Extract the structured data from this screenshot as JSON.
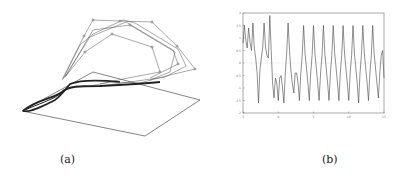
{
  "figure": {
    "panels": [
      {
        "id": "a",
        "caption": "(a)",
        "description": "3D trajectory plot: thick dense loop curve near a plane with polygonal control-point overlays above"
      },
      {
        "id": "b",
        "caption": "(b)",
        "description": "Time series oscillation plot"
      }
    ]
  },
  "captions": {
    "a": "(a)",
    "b": "(b)"
  },
  "chart_data": [
    {
      "type": "line",
      "title": "",
      "xlabel": "",
      "ylabel": "",
      "x_ticks": [
        "-5",
        "0",
        "5",
        "10",
        "15"
      ],
      "y_ticks": [
        "2",
        "1.5",
        "1",
        "0.5",
        "0",
        "-0.5",
        "-1",
        "-1.5",
        "-2"
      ],
      "xlim": [
        -5,
        15
      ],
      "ylim": [
        -2,
        2
      ],
      "grid": false,
      "series": [
        {
          "name": "signal",
          "x": [
            -5,
            -4.8,
            -4.6,
            -4.4,
            -4.2,
            -4.0,
            -3.8,
            -3.6,
            -3.4,
            -3.2,
            -3.0,
            -2.8,
            -2.6,
            -2.4,
            -2.2,
            -2.0,
            -1.8,
            -1.6,
            -1.4,
            -1.2,
            -1.0,
            -0.8,
            -0.6,
            -0.4,
            -0.2,
            0.0,
            0.2,
            0.4,
            0.6,
            0.8,
            1.0,
            1.2,
            1.4,
            1.6,
            1.8,
            2.0,
            2.2,
            2.4,
            2.6,
            2.8,
            3.0,
            3.2,
            3.4,
            3.6,
            3.8,
            4.0,
            4.2,
            4.4,
            4.6,
            4.8,
            5.0,
            5.2,
            5.4,
            5.6,
            5.8,
            6.0,
            6.2,
            6.4,
            6.6,
            6.8,
            7.0,
            7.2,
            7.4,
            7.6,
            7.8,
            8.0,
            8.2,
            8.4,
            8.6,
            8.8,
            9.0,
            9.2,
            9.4,
            9.6,
            9.8,
            10.0,
            10.2,
            10.4,
            10.6,
            10.8,
            11.0,
            11.2,
            11.4,
            11.6,
            11.8,
            12.0,
            12.2,
            12.4,
            12.6,
            12.8,
            13.0,
            13.2,
            13.4,
            13.6,
            13.8,
            14.0,
            14.2,
            14.4,
            14.6,
            14.8,
            15.0
          ],
          "y": [
            0.8,
            1.5,
            0.9,
            0.6,
            1.4,
            0.8,
            0.5,
            1.6,
            0.6,
            0.2,
            -0.4,
            -1.6,
            -0.3,
            0.2,
            0.6,
            1.6,
            0.6,
            0.3,
            0.2,
            1.9,
            0.5,
            -0.8,
            -1.4,
            -0.6,
            -0.8,
            -1.5,
            -0.6,
            -0.5,
            -1.0,
            -1.6,
            -0.4,
            0.4,
            1.6,
            0.5,
            -0.3,
            -0.8,
            -1.2,
            -0.4,
            -0.4,
            -0.8,
            -1.5,
            -0.4,
            0.3,
            1.5,
            0.4,
            -0.2,
            -0.8,
            -1.5,
            -0.4,
            0.3,
            1.5,
            0.4,
            -0.2,
            -0.8,
            -1.5,
            -0.4,
            0.3,
            1.5,
            0.4,
            -0.2,
            -0.8,
            -1.5,
            -0.4,
            0.3,
            1.5,
            0.4,
            -0.2,
            -0.8,
            -1.5,
            -0.4,
            0.3,
            1.5,
            0.4,
            -0.2,
            -0.8,
            -1.5,
            -0.4,
            0.3,
            1.5,
            0.4,
            -0.2,
            -0.8,
            -1.6,
            -0.4,
            0.3,
            1.5,
            0.4,
            -0.2,
            -0.8,
            -1.5,
            -0.4,
            0.3,
            1.5,
            0.4,
            -0.2,
            -0.8,
            -1.4,
            -0.4,
            0.3,
            0.5,
            -0.6
          ]
        }
      ]
    }
  ]
}
